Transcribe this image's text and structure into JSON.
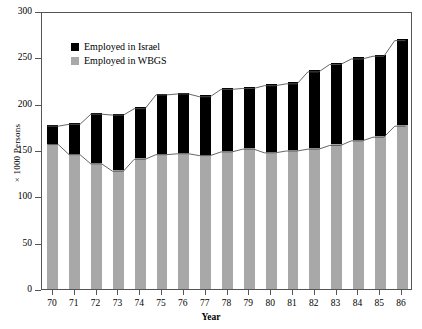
{
  "chart_data": {
    "type": "bar",
    "stacked": true,
    "title": "",
    "xlabel": "Year",
    "ylabel": "× 1000 Persons",
    "categories": [
      "70",
      "71",
      "72",
      "73",
      "74",
      "75",
      "76",
      "77",
      "78",
      "79",
      "80",
      "81",
      "82",
      "83",
      "84",
      "85",
      "86"
    ],
    "ylim": [
      0,
      300
    ],
    "yticks": [
      0,
      50,
      100,
      150,
      200,
      250,
      300
    ],
    "grid": false,
    "legend_position": "upper-left-inside",
    "series": [
      {
        "name": "Employed in WBGS",
        "color": "#a8a8a8",
        "values": [
          157,
          146,
          136,
          128,
          141,
          146,
          147,
          145,
          149,
          152,
          148,
          150,
          152,
          156,
          161,
          165,
          177
        ]
      },
      {
        "name": "Employed in Israel",
        "color": "#000000",
        "values": [
          20,
          33,
          54,
          61,
          55,
          65,
          65,
          64,
          68,
          66,
          73,
          73,
          84,
          88,
          89,
          88,
          93
        ]
      }
    ],
    "totals": [
      177,
      179,
      190,
      189,
      196,
      211,
      212,
      209,
      217,
      218,
      221,
      223,
      236,
      244,
      250,
      253,
      270
    ]
  },
  "legend": {
    "items": [
      {
        "label": "Employed in Israel",
        "color": "#000000"
      },
      {
        "label": "Employed in WBGS",
        "color": "#a8a8a8"
      }
    ]
  },
  "axes": {
    "y_title": "× 1000 Persons",
    "x_title": "Year",
    "y_tick_labels": [
      "300",
      "250",
      "200",
      "150",
      "100",
      "50",
      "0"
    ],
    "x_tick_labels": [
      "70",
      "71",
      "72",
      "73",
      "74",
      "75",
      "76",
      "77",
      "78",
      "79",
      "80",
      "81",
      "82",
      "83",
      "84",
      "85",
      "86"
    ]
  }
}
